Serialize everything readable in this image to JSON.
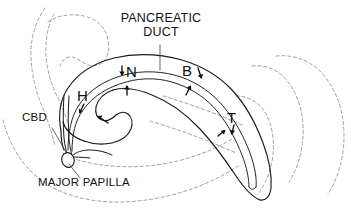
{
  "figure": {
    "kind": "anatomical-line-diagram",
    "width": 351,
    "height": 217,
    "background_color": "#ffffff",
    "ink_color": "#111111",
    "contour_color": "#9a9a9a"
  },
  "labels": {
    "pancreatic_duct_line1": "PANCREATIC",
    "pancreatic_duct_line2": "DUCT",
    "cbd": "CBD",
    "major_papilla": "MAJOR PAPILLA",
    "segment_head": "H",
    "segment_neck": "N",
    "segment_body": "B",
    "segment_tail": "T"
  },
  "legend_meaning": {
    "H": "Head",
    "N": "Neck",
    "B": "Body",
    "T": "Tail",
    "CBD": "Common bile duct"
  },
  "markers": [
    {
      "id": "marker-head",
      "label": "H",
      "x": 84,
      "y": 97
    },
    {
      "id": "marker-neck",
      "label": "N",
      "x": 131,
      "y": 74
    },
    {
      "id": "marker-body",
      "label": "B",
      "x": 188,
      "y": 73
    },
    {
      "id": "marker-tail",
      "label": "T",
      "x": 233,
      "y": 120
    }
  ],
  "callouts": [
    {
      "id": "callout-pancreatic-duct",
      "text": "PANCREATIC DUCT",
      "anchor_x": 160,
      "anchor_y": 68
    },
    {
      "id": "callout-cbd",
      "text": "CBD",
      "anchor_x": 69,
      "anchor_y": 152
    },
    {
      "id": "callout-major-papilla",
      "text": "MAJOR PAPILLA",
      "anchor_x": 70,
      "anchor_y": 155
    }
  ]
}
